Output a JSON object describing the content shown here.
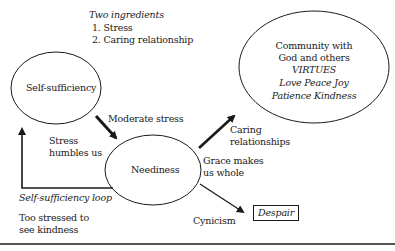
{
  "diagram": {
    "ingredients": {
      "title": "Two ingredients",
      "items": [
        "1. Stress",
        "2. Caring relationship"
      ]
    },
    "nodes": {
      "self_sufficiency": "Self-sufficiency",
      "neediness": "Neediness",
      "community": {
        "line1": "Community with",
        "line2": "God and others",
        "virtues_title": "VIRTUES",
        "virtues_line1": "Love  Peace  Joy",
        "virtues_line2": "Patience   Kindness"
      },
      "despair": "Despair"
    },
    "edge_labels": {
      "moderate_stress": "Moderate stress",
      "stress_humbles_1": "Stress",
      "stress_humbles_2": "humbles us",
      "caring_1": "Caring",
      "caring_2": "relationships",
      "grace_1": "Grace makes",
      "grace_2": "us whole",
      "cynicism": "Cynicism",
      "loop_title": "Self-sufficiency loop",
      "loop_desc_1": "Too stressed to",
      "loop_desc_2": "see kindness"
    },
    "colors": {
      "stroke": "#1a1a1a",
      "background": "#ffffff",
      "rule": "#555555"
    }
  }
}
